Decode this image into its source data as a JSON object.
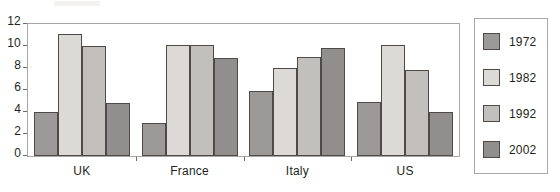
{
  "chart_data": {
    "type": "bar",
    "title": "",
    "subtitle": "",
    "xlabel": "",
    "ylabel": "",
    "categories": [
      "UK",
      "France",
      "Italy",
      "US"
    ],
    "series": [
      {
        "name": "1972",
        "color": "#9c9a98",
        "values": [
          4.0,
          3.0,
          5.9,
          4.9
        ]
      },
      {
        "name": "1982",
        "color": "#dcdad7",
        "values": [
          11.1,
          10.1,
          8.0,
          10.1
        ]
      },
      {
        "name": "1992",
        "color": "#c2c0bd",
        "values": [
          10.0,
          10.1,
          9.0,
          7.8
        ]
      },
      {
        "name": "2002",
        "color": "#918f8d",
        "values": [
          4.8,
          8.9,
          9.8,
          4.0
        ]
      }
    ],
    "ylim": [
      0,
      12
    ],
    "yticks": [
      0,
      2,
      4,
      6,
      8,
      10,
      12
    ],
    "ytick_labels": [
      "0",
      "2",
      "4",
      "6",
      "8",
      "10",
      "12"
    ],
    "grid": false,
    "legend_position": "right",
    "bar_edge_color": "#4d4a47",
    "axis_color": "#a9a7a4",
    "background": "#ffffff"
  },
  "legend": {
    "items": [
      {
        "label": "1972"
      },
      {
        "label": "1982"
      },
      {
        "label": "1992"
      },
      {
        "label": "2002"
      }
    ]
  }
}
